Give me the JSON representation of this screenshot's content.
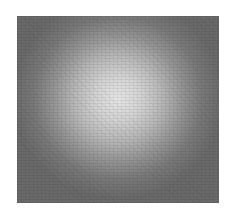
{
  "image": {
    "description": "Grayscale noisy bright circular spot centered on a gray square",
    "colors": {
      "background": "#ffffff",
      "frame": "#6e6e6e",
      "spot_center": "#e6e6e6"
    }
  }
}
